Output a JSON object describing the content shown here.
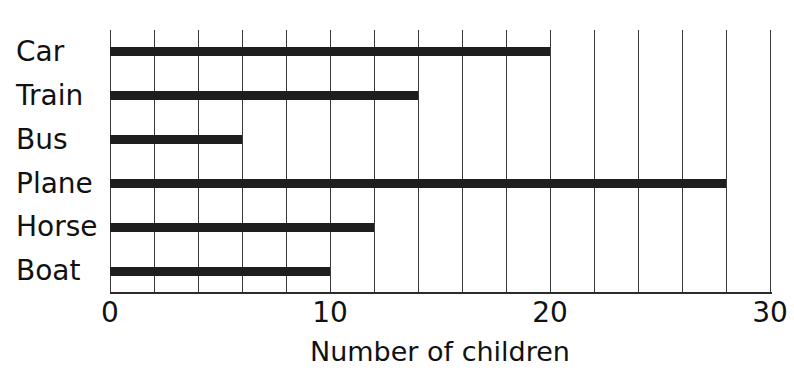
{
  "chart_data": {
    "type": "bar",
    "orientation": "horizontal",
    "title": "",
    "title_note": "cropped off top edge of screenshot, illegible",
    "categories": [
      "Car",
      "Train",
      "Bus",
      "Plane",
      "Horse",
      "Boat"
    ],
    "values": [
      20,
      14,
      6,
      28,
      12,
      10
    ],
    "xlabel": "Number of children",
    "ylabel": "",
    "xlim": [
      0,
      30
    ],
    "xticks": [
      0,
      10,
      20,
      30
    ],
    "xtick_labels": [
      "0",
      "10",
      "20",
      "30"
    ],
    "gridlines": [
      0,
      2,
      4,
      6,
      8,
      10,
      12,
      14,
      16,
      18,
      20,
      22,
      24,
      26,
      28,
      30
    ],
    "grid": true,
    "grid_step": 2,
    "legend": null,
    "bar_color": "#1e1e1e",
    "grid_color": "#3a3a3a",
    "axis_color": "#2b2b2b",
    "background_color": "#ffffff"
  },
  "axis": {
    "x_title": "Number of children"
  }
}
